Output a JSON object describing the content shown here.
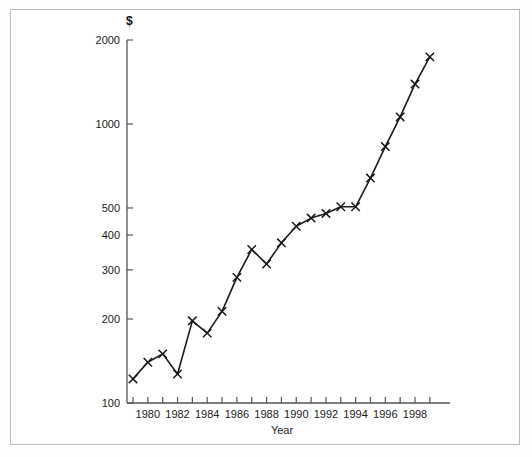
{
  "chart_data": {
    "type": "line",
    "title": "",
    "subtitle": "",
    "xlabel": "Year",
    "ylabel": "$",
    "yscale": "log",
    "ylim": [
      100,
      2000
    ],
    "xlim": [
      1978.6,
      1999.4
    ],
    "grid": false,
    "legend": null,
    "marker": "x",
    "line_color": "#1a1a1a",
    "x": [
      1979,
      1980,
      1981,
      1982,
      1983,
      1984,
      1985,
      1986,
      1987,
      1988,
      1989,
      1990,
      1991,
      1992,
      1993,
      1994,
      1995,
      1996,
      1997,
      1998,
      1999
    ],
    "values": [
      122,
      140,
      150,
      127,
      197,
      178,
      213,
      282,
      355,
      315,
      375,
      430,
      460,
      478,
      505,
      505,
      640,
      830,
      1060,
      1390,
      1740
    ],
    "ytick_values": [
      100,
      200,
      300,
      400,
      500,
      1000,
      2000
    ],
    "ytick_labels": [
      "100",
      "200",
      "300",
      "400",
      "500",
      "1000",
      "2000"
    ],
    "xtick_values": [
      1979,
      1980,
      1981,
      1982,
      1983,
      1984,
      1985,
      1986,
      1987,
      1988,
      1989,
      1990,
      1991,
      1992,
      1993,
      1994,
      1995,
      1996,
      1997,
      1998,
      1999
    ],
    "xtick_labeled": [
      1980,
      1982,
      1984,
      1986,
      1988,
      1990,
      1992,
      1994,
      1996,
      1998
    ],
    "xtick_labels": [
      "1980",
      "1982",
      "1984",
      "1986",
      "1988",
      "1990",
      "1992",
      "1994",
      "1996",
      "1998"
    ]
  },
  "figure": {
    "border_color": "#b9b9b9",
    "axis_color": "#555555",
    "background": "#ffffff"
  }
}
